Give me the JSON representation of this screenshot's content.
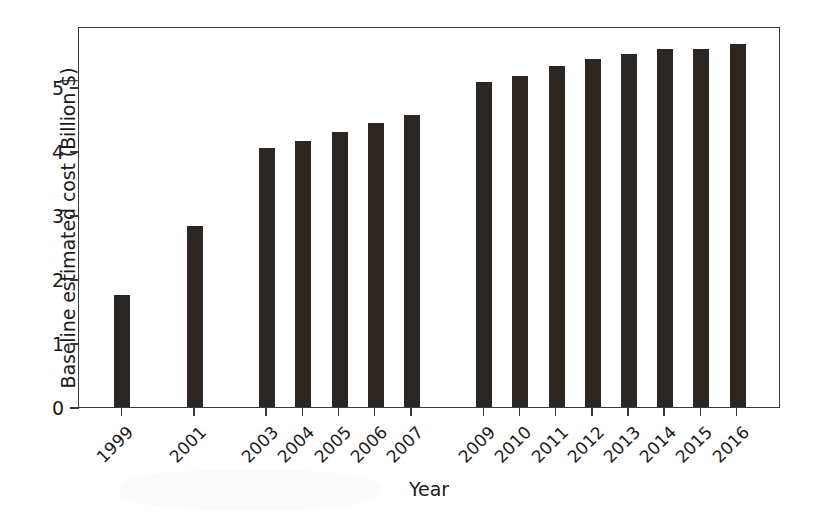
{
  "chart_data": {
    "type": "bar",
    "title": "",
    "xlabel": "Year",
    "ylabel": "Baseline estimated cost (Billion $)",
    "categories": [
      "1999",
      "2001",
      "2003",
      "2004",
      "2005",
      "2006",
      "2007",
      "2009",
      "2010",
      "2011",
      "2012",
      "2013",
      "2014",
      "2015",
      "2016"
    ],
    "values": [
      1.75,
      2.82,
      4.05,
      4.15,
      4.29,
      4.43,
      4.56,
      5.08,
      5.17,
      5.33,
      5.44,
      5.52,
      5.59,
      5.59,
      5.67
    ],
    "ylim": [
      0,
      5.95
    ],
    "yticks": [
      0,
      1,
      2,
      3,
      4,
      5
    ],
    "yticklabels": [
      "0",
      "1",
      "2",
      "3",
      "4",
      "5"
    ],
    "xticklabels": [
      "1999",
      "2001",
      "2003",
      "2004",
      "2005",
      "2006",
      "2007",
      "2009",
      "2010",
      "2011",
      "2012",
      "2013",
      "2014",
      "2015",
      "2016"
    ],
    "xtick_positions": [
      1999,
      2001,
      2003,
      2004,
      2005,
      2006,
      2007,
      2009,
      2010,
      2011,
      2012,
      2013,
      2014,
      2015,
      2016
    ],
    "xlim": [
      1997.8,
      2017.2
    ],
    "grid": false,
    "legend": null,
    "bar_color": "#2b2622",
    "axis_color": "#3a3a3a",
    "background_color": "#ffffff",
    "tick_label_rotation": -45,
    "missing_years": [
      "1998",
      "2000",
      "2002",
      "2008"
    ]
  }
}
